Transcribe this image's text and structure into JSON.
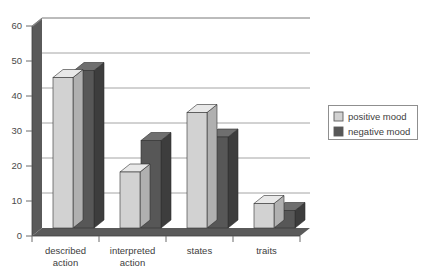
{
  "chart_data": {
    "type": "bar",
    "title": "",
    "subtitle": "",
    "xlabel": "",
    "ylabel": "",
    "categories": [
      "described action",
      "interpreted action",
      "states",
      "traits"
    ],
    "category_lines": [
      [
        "described",
        "action"
      ],
      [
        "interpreted",
        "action"
      ],
      [
        "states",
        ""
      ],
      [
        "traits",
        ""
      ]
    ],
    "series": [
      {
        "name": "positive mood",
        "color": "#d2d2d2",
        "values": [
          43,
          16,
          33,
          7
        ]
      },
      {
        "name": "negative mood",
        "color": "#575757",
        "values": [
          45,
          25,
          26,
          5
        ]
      }
    ],
    "yticks": [
      0,
      10,
      20,
      30,
      40,
      50,
      60
    ],
    "ylim": [
      0,
      60
    ],
    "grid": true,
    "grid_axis": "y",
    "legend_position": "right",
    "style": "3d-bars"
  },
  "legend": {
    "items": [
      {
        "label": "positive mood",
        "swatch": "#d2d2d2"
      },
      {
        "label": "negative mood",
        "swatch": "#575757"
      }
    ]
  },
  "axis": {
    "y_tick_labels": [
      "60",
      "50",
      "40",
      "30",
      "20",
      "10",
      "0"
    ]
  },
  "colors": {
    "bar_light_front": "#d2d2d2",
    "bar_light_top": "#e8e8e8",
    "bar_light_side": "#b0b0b0",
    "bar_dark_front": "#575757",
    "bar_dark_top": "#6f6f6f",
    "bar_dark_side": "#3d3d3d",
    "axis_wall": "#5a5a5a",
    "gridline": "#9a9a9a",
    "text": "#3d3d3d",
    "background": "#ffffff"
  }
}
